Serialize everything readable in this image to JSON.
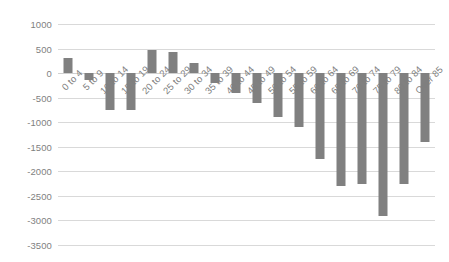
{
  "chart_data": {
    "type": "bar",
    "title": "",
    "subtitle": "",
    "xlabel": "",
    "ylabel": "",
    "ylim": [
      -3500,
      1000
    ],
    "ytick_step": 500,
    "grid": true,
    "legend": false,
    "legend_position": "none",
    "bar_color": "#808080",
    "gridline_color": "#d9d9d9",
    "axis_text_color": "#7f7f7f",
    "xtick_rotation": -45,
    "categories": [
      "0 to 4",
      "5 to 9",
      "10 to 14",
      "15 to 19",
      "20 to 24",
      "25 to 29",
      "30 to 34",
      "35 to 39",
      "40 to 44",
      "45 to 49",
      "50 to 54",
      "55 to 59",
      "60 to 64",
      "65 to 69",
      "70 to 74",
      "75 to 79",
      "80 to 84",
      "Over 85"
    ],
    "values": [
      300,
      -150,
      -750,
      -750,
      470,
      420,
      200,
      -200,
      -400,
      -600,
      -900,
      -1100,
      -1750,
      -2300,
      -2250,
      -2900,
      -2250,
      -1400
    ],
    "yticks": [
      1000,
      500,
      0,
      -500,
      -1000,
      -1500,
      -2000,
      -2500,
      -3000,
      -3500
    ],
    "ytick_labels": [
      "1000",
      "500",
      "0",
      "-500",
      "-1000",
      "-1500",
      "-2000",
      "-2500",
      "-3000",
      "-3500"
    ]
  }
}
